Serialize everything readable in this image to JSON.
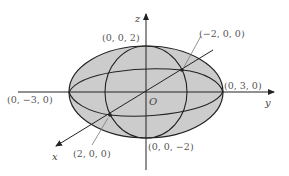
{
  "diagram": {
    "colors": {
      "fill": "#cccccc",
      "stroke": "#222222",
      "label": "#555555",
      "background": "#ffffff"
    },
    "axes": {
      "x": "x",
      "y": "y",
      "z": "z",
      "origin": "O"
    },
    "points": {
      "z_top": "(0, 0, 2)",
      "z_bottom": "(0, 0, −2)",
      "y_pos": "(0, 3, 0)",
      "y_neg": "(0, −3, 0)",
      "x_pos": "(2, 0, 0)",
      "x_neg": "(−2, 0, 0)"
    }
  }
}
